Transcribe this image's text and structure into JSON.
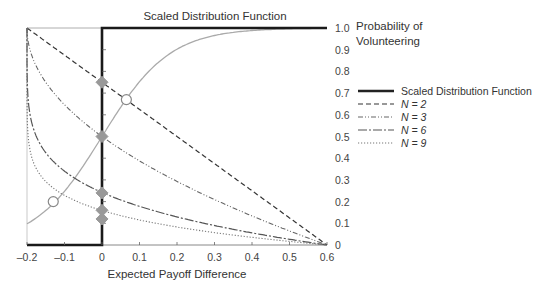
{
  "chart_data": {
    "type": "line",
    "title": "Scaled Distribution Function",
    "xlabel": "Expected Payoff Difference",
    "ylabel": "Probability of Volunteering",
    "ylabel_lines": [
      "Probability of",
      "Volunteering"
    ],
    "xlim": [
      -0.2,
      0.6
    ],
    "ylim": [
      0,
      1.0
    ],
    "x_ticks": [
      "-0.2",
      "-0.1",
      "0",
      "0.1",
      "0.2",
      "0.3",
      "0.4",
      "0.5",
      "0.6"
    ],
    "x_tick_values": [
      -0.2,
      -0.1,
      0,
      0.1,
      0.2,
      0.3,
      0.4,
      0.5,
      0.6
    ],
    "y_ticks": [
      "0",
      "0.1",
      "0.2",
      "0.3",
      "0.4",
      "0.5",
      "0.6",
      "0.7",
      "0.8",
      "0.9",
      "1.0"
    ],
    "y_tick_values": [
      0,
      0.1,
      0.2,
      0.3,
      0.4,
      0.5,
      0.6,
      0.7,
      0.8,
      0.9,
      1.0
    ],
    "grid": false,
    "legend_position": "right",
    "series": [
      {
        "name": "Scaled Distribution Function",
        "style": "solid-thick",
        "x": [
          -0.2,
          0,
          0,
          0.6
        ],
        "values": [
          0,
          0,
          1,
          1
        ]
      },
      {
        "name": "N = 2",
        "style": "dashed",
        "x": [
          -0.2,
          0,
          0.2,
          0.4,
          0.6
        ],
        "values": [
          1.0,
          0.75,
          0.5,
          0.25,
          0
        ]
      },
      {
        "name": "N = 3",
        "style": "dash-dot-dot",
        "x": [
          -0.2,
          -0.15,
          -0.1,
          0,
          0.2,
          0.4,
          0.6
        ],
        "values": [
          1.0,
          0.65,
          0.5,
          0.5,
          0.29,
          0.13,
          0
        ]
      },
      {
        "name": "N = 6",
        "style": "long-dash-dot",
        "x": [
          -0.2,
          -0.15,
          -0.1,
          0,
          0.2,
          0.4,
          0.6
        ],
        "values": [
          1.0,
          0.42,
          0.33,
          0.24,
          0.13,
          0.06,
          0
        ]
      },
      {
        "name": "N = 9",
        "style": "dotted",
        "x": [
          -0.2,
          -0.15,
          -0.1,
          0,
          0.2,
          0.4,
          0.6
        ],
        "values": [
          1.0,
          0.29,
          0.21,
          0.16,
          0.08,
          0.04,
          0
        ]
      },
      {
        "name": "Logistic distribution (grey)",
        "style": "solid-grey",
        "x": [
          -0.2,
          -0.13,
          0,
          0.065,
          0.2,
          0.4,
          0.6
        ],
        "values": [
          0.1,
          0.19,
          0.5,
          0.67,
          0.9,
          0.99,
          1.0
        ]
      }
    ],
    "markers": {
      "diamonds_at_x0": [
        0.75,
        0.5,
        0.24,
        0.16,
        0.12
      ],
      "open_circles": [
        {
          "x": 0.065,
          "y": 0.67
        },
        {
          "x": -0.13,
          "y": 0.2
        }
      ]
    }
  },
  "legend": {
    "items": [
      {
        "label": "Scaled Distribution Function"
      },
      {
        "label": "N = 2"
      },
      {
        "label": "N = 3"
      },
      {
        "label": "N = 6"
      },
      {
        "label": "N = 9"
      }
    ]
  }
}
